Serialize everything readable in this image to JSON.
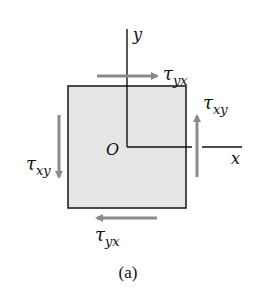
{
  "diagram": {
    "caption": "(a)",
    "axes": {
      "y_label": "y",
      "x_label": "x",
      "origin_label": "O"
    },
    "stresses": {
      "top": {
        "symbol": "τ",
        "subscript": "yx",
        "direction": "right"
      },
      "bottom": {
        "symbol": "τ",
        "subscript": "yx",
        "direction": "left"
      },
      "right": {
        "symbol": "τ",
        "subscript": "xy",
        "direction": "up"
      },
      "left": {
        "symbol": "τ",
        "subscript": "xy",
        "direction": "down"
      }
    },
    "colors": {
      "element_fill": "#e6e6e6",
      "element_stroke": "#222222",
      "arrow": "#8a8a8a",
      "axis": "#111111"
    }
  }
}
